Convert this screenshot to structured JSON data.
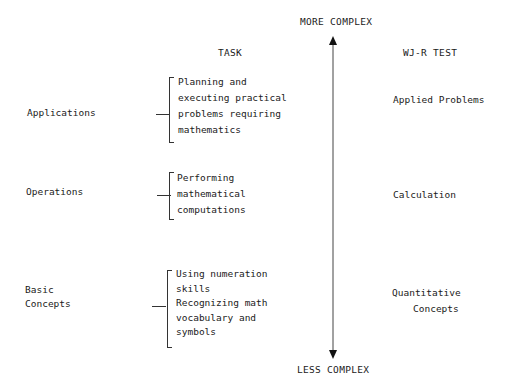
{
  "axis": {
    "top_label": "MORE COMPLEX",
    "bottom_label": "LESS COMPLEX"
  },
  "headers": {
    "task": "TASK",
    "test": "WJ-R TEST"
  },
  "rows": [
    {
      "category": [
        "Applications"
      ],
      "task_lines": [
        "Planning and",
        "executing practical",
        "problems requiring",
        "mathematics"
      ],
      "test": [
        "Applied Problems"
      ]
    },
    {
      "category": [
        "Operations"
      ],
      "task_lines": [
        "Performing",
        "mathematical",
        "computations"
      ],
      "test": [
        "Calculation"
      ]
    },
    {
      "category": [
        "Basic",
        "Concepts"
      ],
      "task_lines": [
        "Using numeration",
        "skills",
        "Recognizing math",
        "vocabulary and",
        "symbols"
      ],
      "test": [
        "Quantitative",
        "Concepts"
      ]
    }
  ]
}
